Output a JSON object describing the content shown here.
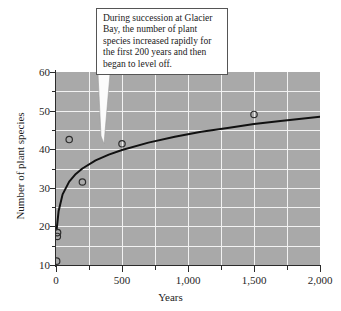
{
  "chart_data": {
    "type": "scatter",
    "title": "",
    "xlabel": "Years",
    "ylabel": "Number of plant species",
    "xlim": [
      0,
      2000
    ],
    "ylim": [
      10,
      60
    ],
    "grid": true,
    "legend_position": "none",
    "x_ticks_major": [
      0,
      500,
      1000,
      1500,
      2000
    ],
    "x_tick_labels": [
      "0",
      "500",
      "1,000",
      "1,500",
      "2,000"
    ],
    "x_ticks_minor": [
      250,
      750,
      1250,
      1750
    ],
    "y_ticks_major": [
      10,
      20,
      30,
      40,
      50,
      60
    ],
    "y_tick_labels": [
      "10",
      "20",
      "30",
      "40",
      "50",
      "60"
    ],
    "y_ticks_minor": [
      15,
      25,
      35,
      45,
      55
    ],
    "points": [
      {
        "x": 5,
        "y": 11
      },
      {
        "x": 10,
        "y": 17.4
      },
      {
        "x": 12,
        "y": 18.4
      },
      {
        "x": 100,
        "y": 42.5
      },
      {
        "x": 200,
        "y": 31.5
      },
      {
        "x": 500,
        "y": 41.4
      },
      {
        "x": 1500,
        "y": 49
      }
    ],
    "series": [
      {
        "name": "fitted curve",
        "type": "line",
        "x": [
          5,
          20,
          50,
          100,
          150,
          200,
          300,
          400,
          500,
          700,
          900,
          1100,
          1300,
          1500,
          1700,
          2000
        ],
        "values": [
          19.2,
          24.0,
          28.3,
          31.6,
          33.6,
          35.0,
          37.1,
          38.6,
          39.8,
          41.7,
          43.2,
          44.5,
          45.5,
          46.5,
          47.3,
          48.4
        ]
      }
    ],
    "annotations": [
      {
        "id": "succession-callout",
        "text": "During succession at Glacier Bay, the number of plant species increased rapidly for the first 200 years and then began to level off.",
        "points_to": {
          "x": 500,
          "y": 41.4
        }
      }
    ]
  },
  "colors": {
    "plot_background": "#a9a9a9",
    "gridline": "#f2f2f2",
    "axis": "#2b2b2b",
    "curve": "#111111",
    "marker_stroke": "#2d2d2d",
    "callout_background": "#ffffff",
    "callout_border": "#555555",
    "text": "#1a1a1a"
  }
}
